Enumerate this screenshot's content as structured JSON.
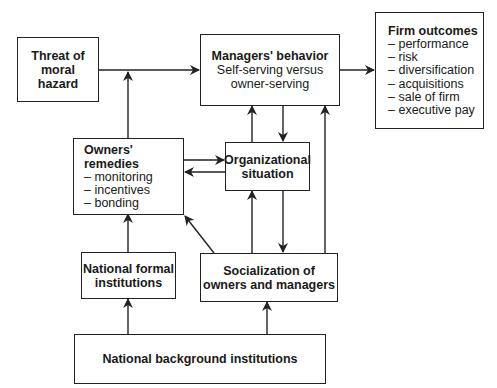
{
  "diagram": {
    "nodes": {
      "threat": {
        "title": "Threat of\nmoral\nhazard"
      },
      "managers": {
        "title": "Managers' behavior",
        "subtitle": "Self-serving versus\nowner-serving"
      },
      "firm_outcomes": {
        "title": "Firm outcomes",
        "items": [
          "– performance",
          "– risk",
          "– diversification",
          "– acquisitions",
          "– sale of firm",
          "– executive pay"
        ]
      },
      "owners_remedies": {
        "title": "Owners' remedies",
        "items": [
          "– monitoring",
          "– incentives",
          "– bonding"
        ]
      },
      "organizational": {
        "title": "Organizational\nsituation"
      },
      "national_formal": {
        "title": "National formal\ninstitutions"
      },
      "socialization": {
        "title": "Socialization of\nowners and managers"
      },
      "national_background": {
        "title": "National background institutions"
      }
    },
    "edges": [
      {
        "from": "threat",
        "to": "managers"
      },
      {
        "from": "owners_remedies",
        "to": "threat_managers_link"
      },
      {
        "from": "managers",
        "to": "firm_outcomes"
      },
      {
        "from": "owners_remedies",
        "to": "organizational"
      },
      {
        "from": "organizational",
        "to": "owners_remedies"
      },
      {
        "from": "organizational",
        "to": "managers"
      },
      {
        "from": "managers",
        "to": "organizational"
      },
      {
        "from": "socialization",
        "to": "organizational"
      },
      {
        "from": "organizational",
        "to": "socialization"
      },
      {
        "from": "socialization",
        "to": "managers"
      },
      {
        "from": "socialization",
        "to": "owners_remedies"
      },
      {
        "from": "national_formal",
        "to": "owners_remedies"
      },
      {
        "from": "national_background",
        "to": "national_formal"
      },
      {
        "from": "national_background",
        "to": "socialization"
      }
    ],
    "colors": {
      "line": "#222222",
      "background": "#ffffff"
    }
  }
}
